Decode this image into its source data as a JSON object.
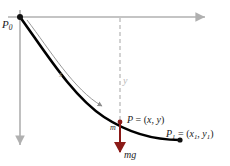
{
  "figure": {
    "background_color": "#ffffff"
  },
  "colors": {
    "axis": "#b0b0b0",
    "curve": "#000000",
    "arc_arrow": "#8c8c8c",
    "dashed_guide": "#b5b5b5",
    "force_arrow": "#8b1a18",
    "mass_marker": "#8b1a18",
    "label_text": "#1a1a1a",
    "faint_label": "#b9b9b9"
  },
  "axes": {
    "horizontal": {
      "name_label": "x-axis",
      "from": [
        8,
        17
      ],
      "to": [
        207,
        17
      ],
      "arrow": "right"
    },
    "vertical": {
      "name_label": "y-axis",
      "from": [
        20,
        10
      ],
      "to": [
        20,
        147
      ],
      "arrow": "down"
    }
  },
  "points": {
    "start": {
      "id": "P0",
      "label_main": "P",
      "label_sub": "0",
      "coords_px": [
        20,
        17
      ]
    },
    "moving": {
      "id": "P",
      "label": "P = (x , y)",
      "label_main": "P",
      "equals": " = (",
      "var_x": "x",
      "comma": ", ",
      "var_y": "y",
      "close": ")",
      "coords_px": [
        120,
        122
      ]
    },
    "end": {
      "id": "P1",
      "label_main": "P",
      "label_sub": "1",
      "equals": " = (",
      "var_x": "x",
      "sub_x": "1",
      "comma": ", ",
      "var_y": "y",
      "sub_y": "1",
      "close": ")",
      "coords_px": [
        180,
        140
      ]
    }
  },
  "labels": {
    "arc_length": "s",
    "depth": "y",
    "mass": "m",
    "weight_force": "mg"
  },
  "curve": {
    "name": "brachistochrone-path",
    "path_d": "M 20 17 C 44 50, 72 96, 104 117 C 130 134, 158 140, 180 140",
    "stroke_width": 2.6
  },
  "arc_arrow": {
    "name": "arc-length-indicator",
    "path_d": "M 27 20 C 50 50, 74 90, 103 107",
    "stroke_width": 0.9
  },
  "guide_line": {
    "name": "vertical-depth-guide",
    "from": [
      120,
      18
    ],
    "to": [
      120,
      122
    ],
    "dash": "4 3"
  },
  "force_vector": {
    "name": "gravity-force-vector",
    "from": [
      120,
      124
    ],
    "to": [
      120,
      155
    ],
    "stroke_width": 2
  }
}
